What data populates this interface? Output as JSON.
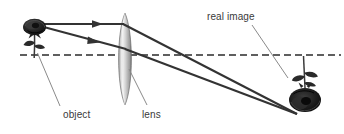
{
  "figure": {
    "kind": "optics-ray-diagram",
    "background_color": "#ffffff"
  },
  "labels": {
    "real_image": "real image",
    "object": "object",
    "lens": "lens"
  },
  "colors": {
    "ray": "#333333",
    "axis": "#2b2b2b",
    "leader": "#8a8a8a",
    "lens_light": "#f2f2f2",
    "lens_mid": "#b9b9b9",
    "lens_dark": "#8e8e8e",
    "rose": "#262626",
    "rose_dark": "#111111",
    "stem": "#3d3d3d",
    "text": "#3a3a3a"
  },
  "elements": {
    "optical_axis": {
      "name": "optical-axis",
      "style": "dashed",
      "y": 55,
      "x_start": 20,
      "x_end": 341
    },
    "lens": {
      "name": "converging-lens",
      "center_x": 125,
      "top_y": 13,
      "bottom_y": 105,
      "half_width": 8
    },
    "object_rose": {
      "name": "object-rose",
      "x": 32,
      "top_y": 20,
      "base_y": 55
    },
    "image_rose": {
      "name": "image-rose",
      "x": 305,
      "base_y": 56,
      "bottom_y": 116,
      "inverted": true
    },
    "rays": [
      {
        "name": "parallel-ray-incident",
        "from": [
          40,
          24
        ],
        "to": [
          122,
          24
        ],
        "arrow_at": [
          99,
          24
        ]
      },
      {
        "name": "parallel-ray-refracted",
        "from": [
          122,
          24
        ],
        "to": [
          297,
          114
        ]
      },
      {
        "name": "chief-ray-incident",
        "from": [
          40,
          26
        ],
        "to": [
          125,
          49
        ],
        "arrow_at": [
          96,
          42
        ]
      },
      {
        "name": "chief-ray-refracted",
        "from": [
          125,
          49
        ],
        "to": [
          297,
          114
        ]
      }
    ],
    "leaders": [
      {
        "name": "leader-object",
        "from": [
          60,
          106
        ],
        "to": [
          38,
          53
        ]
      },
      {
        "name": "leader-lens",
        "from": [
          147,
          105
        ],
        "to": [
          129,
          69
        ]
      },
      {
        "name": "leader-real-image",
        "from": [
          252,
          25
        ],
        "to": [
          288,
          78
        ]
      }
    ]
  }
}
